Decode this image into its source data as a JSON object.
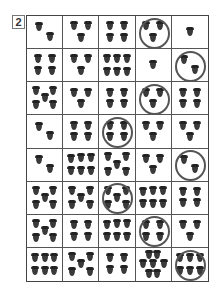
{
  "problem_label": "2",
  "grid": {
    "rows": 8,
    "cols": 5,
    "acorn_color": "#3a3a3a",
    "circle_color": "#555555",
    "cells": [
      [
        {
          "count": 2,
          "circled": false
        },
        {
          "count": 3,
          "circled": false
        },
        {
          "count": 4,
          "circled": false
        },
        {
          "count": 3,
          "circled": true
        },
        {
          "count": 1,
          "circled": false
        }
      ],
      [
        {
          "count": 4,
          "circled": false
        },
        {
          "count": 3,
          "circled": false
        },
        {
          "count": 6,
          "circled": false
        },
        {
          "count": 1,
          "circled": false
        },
        {
          "count": 2,
          "circled": true
        }
      ],
      [
        {
          "count": 5,
          "circled": false
        },
        {
          "count": 3,
          "circled": false
        },
        {
          "count": 4,
          "circled": false
        },
        {
          "count": 3,
          "circled": true
        },
        {
          "count": 4,
          "circled": false
        }
      ],
      [
        {
          "count": 2,
          "circled": false
        },
        {
          "count": 4,
          "circled": false
        },
        {
          "count": 4,
          "circled": true
        },
        {
          "count": 3,
          "circled": false
        },
        {
          "count": 3,
          "circled": false
        }
      ],
      [
        {
          "count": 2,
          "circled": false
        },
        {
          "count": 6,
          "circled": false
        },
        {
          "count": 5,
          "circled": false
        },
        {
          "count": 3,
          "circled": false
        },
        {
          "count": 2,
          "circled": true
        }
      ],
      [
        {
          "count": 5,
          "circled": false
        },
        {
          "count": 5,
          "circled": false
        },
        {
          "count": 5,
          "circled": true
        },
        {
          "count": 6,
          "circled": false
        },
        {
          "count": 4,
          "circled": false
        }
      ],
      [
        {
          "count": 5,
          "circled": false
        },
        {
          "count": 4,
          "circled": false
        },
        {
          "count": 6,
          "circled": false
        },
        {
          "count": 4,
          "circled": true
        },
        {
          "count": 3,
          "circled": false
        }
      ],
      [
        {
          "count": 6,
          "circled": false
        },
        {
          "count": 5,
          "circled": false
        },
        {
          "count": 4,
          "circled": false
        },
        {
          "count": 7,
          "circled": false
        },
        {
          "count": 6,
          "circled": true
        }
      ]
    ]
  }
}
